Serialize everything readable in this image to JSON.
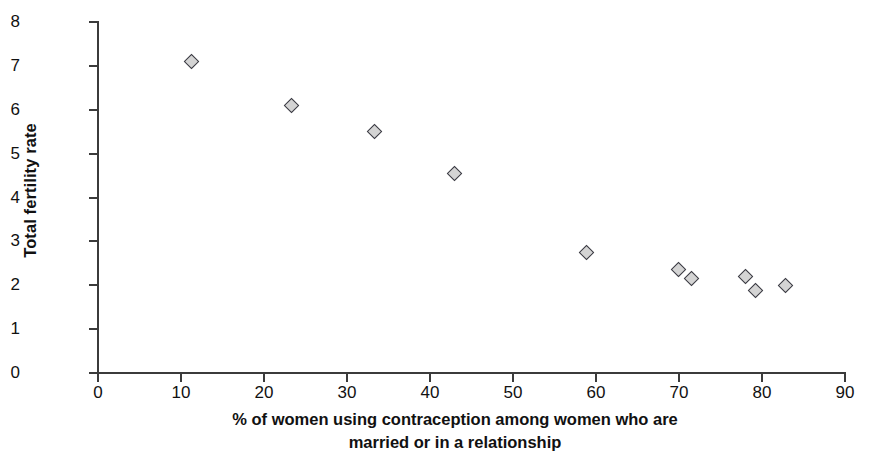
{
  "chart_data": {
    "type": "scatter",
    "title": "",
    "xlabel": "% of women using contraception among women who are married or in a relationship",
    "xlabel_line1": "% of women using contraception among women who are",
    "xlabel_line2": "married or in a relationship",
    "ylabel": "Total fertility rate",
    "xlim": [
      0,
      90
    ],
    "ylim": [
      0,
      8
    ],
    "xticks": [
      0,
      10,
      20,
      30,
      40,
      50,
      60,
      70,
      80,
      90
    ],
    "yticks": [
      0,
      1,
      2,
      3,
      4,
      5,
      6,
      7,
      8
    ],
    "xtick_labels": [
      "0",
      "10",
      "20",
      "30",
      "40",
      "50",
      "60",
      "70",
      "80",
      "90"
    ],
    "ytick_labels": [
      "0",
      "1",
      "2",
      "3",
      "4",
      "5",
      "6",
      "7",
      "8"
    ],
    "grid": false,
    "legend": null,
    "marker": "diamond",
    "marker_fill": "#d4d4d4",
    "marker_edge": "#3a3a42",
    "axis_color": "#3b3b3b",
    "background": "#ffffff",
    "x": [
      11.3,
      23.3,
      33.3,
      43.0,
      58.8,
      69.9,
      71.5,
      78.0,
      79.2,
      82.8
    ],
    "y": [
      7.1,
      6.1,
      5.5,
      4.55,
      2.75,
      2.35,
      2.15,
      2.2,
      1.87,
      2.0
    ],
    "points": [
      {
        "x": 11.3,
        "y": 7.1
      },
      {
        "x": 23.3,
        "y": 6.1
      },
      {
        "x": 33.3,
        "y": 5.5
      },
      {
        "x": 43.0,
        "y": 4.55
      },
      {
        "x": 58.8,
        "y": 2.75
      },
      {
        "x": 69.9,
        "y": 2.35
      },
      {
        "x": 71.5,
        "y": 2.15
      },
      {
        "x": 78.0,
        "y": 2.2
      },
      {
        "x": 79.2,
        "y": 1.87
      },
      {
        "x": 82.8,
        "y": 2.0
      }
    ]
  }
}
